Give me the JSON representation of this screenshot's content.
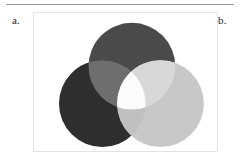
{
  "figure": {
    "panel_labels": {
      "left": "a.",
      "right": "b."
    },
    "frame": {
      "background_color": "#ffffff",
      "border_color": "#e3e3e3"
    }
  },
  "diagram": {
    "type": "venn-three-circle-additive",
    "canvas": {
      "width": 185,
      "height": 140
    },
    "circles": [
      {
        "name": "top-circle",
        "position": "top",
        "cx": 99,
        "cy": 54,
        "r": 44,
        "color": "#4a4a4a"
      },
      {
        "name": "bottom-left-circle",
        "position": "bottom-left",
        "cx": 69,
        "cy": 92,
        "r": 44,
        "color": "#2e2e2e"
      },
      {
        "name": "bottom-right-circle",
        "position": "bottom-right",
        "cx": 128,
        "cy": 92,
        "r": 44,
        "color": "#c8c8c8"
      }
    ],
    "overlaps": [
      {
        "name": "top-and-left-overlap",
        "members": [
          "top-circle",
          "bottom-left-circle"
        ],
        "color": "#6e6e6e"
      },
      {
        "name": "top-and-right-overlap",
        "members": [
          "top-circle",
          "bottom-right-circle"
        ],
        "color": "#d8d8d8"
      },
      {
        "name": "left-and-right-overlap",
        "members": [
          "bottom-left-circle",
          "bottom-right-circle"
        ],
        "color": "#c0c0c0"
      },
      {
        "name": "center-overlap",
        "members": [
          "top-circle",
          "bottom-left-circle",
          "bottom-right-circle"
        ],
        "color": "#fbfbfb"
      }
    ]
  }
}
